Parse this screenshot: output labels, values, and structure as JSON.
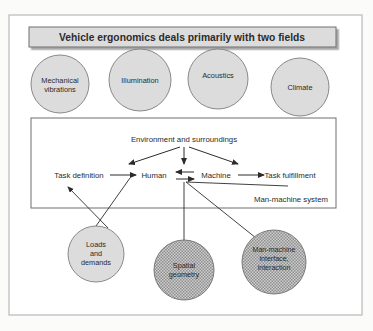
{
  "figure": {
    "title": "Vehicle ergonomics deals primarily with two fields",
    "outer_frame": true,
    "background_color": "#fbfbfa",
    "ink_color": "#2b2b2b"
  },
  "top_factors": {
    "fill_color": "#dcdcdc",
    "items": [
      {
        "id": "mechanical-vibrations",
        "lines": [
          "Mechanical",
          "vibrations"
        ],
        "cx": 60,
        "cy": 84,
        "r": 29
      },
      {
        "id": "illumination",
        "lines": [
          "Illumination"
        ],
        "cx": 140,
        "cy": 80,
        "r": 31
      },
      {
        "id": "acoustics",
        "lines": [
          "Acoustics"
        ],
        "cx": 218,
        "cy": 79,
        "r": 30
      },
      {
        "id": "climate",
        "lines": [
          "Climate"
        ],
        "cx": 300,
        "cy": 87,
        "r": 29
      }
    ]
  },
  "man_machine_system": {
    "box_label": "Man-machine system",
    "nodes": {
      "environment": "Environment and surroundings",
      "task_definition": "Task definition",
      "human": "Human",
      "machine": "Machine",
      "task_fulfillment": "Task fulfillment"
    }
  },
  "bottom_factors": {
    "plain_fill_color": "#dcdcdc",
    "stippled_fill_color": "#a8a8a8",
    "items": [
      {
        "id": "loads-and-demands",
        "lines": [
          "Loads",
          "and",
          "demands"
        ],
        "cx": 96,
        "cy": 254,
        "r": 28,
        "fill": "plain"
      },
      {
        "id": "spatial-geometry",
        "lines": [
          "Spatial",
          "geometry"
        ],
        "cx": 184,
        "cy": 270,
        "r": 30,
        "fill": "stippled"
      },
      {
        "id": "man-machine-interface",
        "lines": [
          "Man-machine",
          "interface,",
          "interaction"
        ],
        "cx": 274,
        "cy": 262,
        "r": 32,
        "fill": "stippled"
      }
    ]
  },
  "connections": [
    {
      "from": "environment",
      "to": "task-definition-side",
      "kind": "arrow"
    },
    {
      "from": "environment",
      "to": "human",
      "kind": "arrow"
    },
    {
      "from": "environment",
      "to": "task-fulfillment-side",
      "kind": "arrow"
    },
    {
      "from": "task-definition",
      "to": "human",
      "kind": "arrow"
    },
    {
      "from": "human",
      "to": "machine",
      "kind": "double-arrow"
    },
    {
      "from": "machine",
      "to": "task-fulfillment",
      "kind": "arrow"
    },
    {
      "from": "loads-and-demands",
      "to": "task-definition",
      "kind": "arrow"
    },
    {
      "from": "spatial-geometry",
      "to": "machine",
      "kind": "line"
    },
    {
      "from": "man-machine-interface",
      "to": "human-machine-link",
      "kind": "line"
    }
  ]
}
